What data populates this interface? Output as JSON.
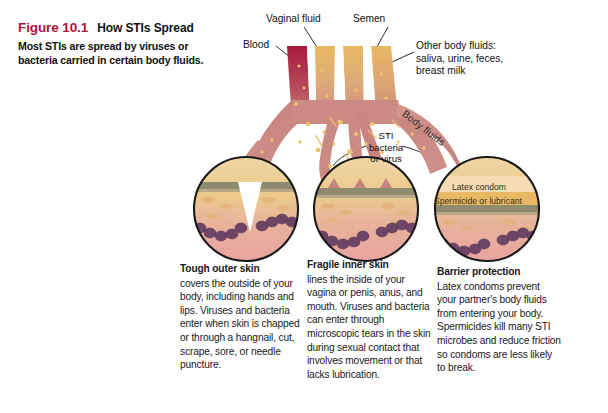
{
  "figure": {
    "number": "Figure 10.1",
    "title": "How STIs Spread",
    "subtitle": "Most STIs are spread by viruses or bacteria carried in certain body fluids."
  },
  "colors": {
    "figure_number": "#b4123c",
    "blood": "#a81b3c",
    "body_fluid": "#e8b863",
    "flesh": "#cc8a84",
    "arrow": "#c9837f",
    "epidermis": "#8e8b6e",
    "dermis": "#eccb8e",
    "subcutaneous": "#e9a99f",
    "cells": "#6e4566",
    "latex_condom": "#f5dcb4",
    "spermicide": "#e8b863"
  },
  "source_labels": [
    {
      "id": "blood",
      "text": "Blood"
    },
    {
      "id": "vaginal",
      "text": "Vaginal fluid"
    },
    {
      "id": "semen",
      "text": "Semen"
    },
    {
      "id": "other",
      "text": "Other body fluids: saliva, urine, feces, breast milk"
    }
  ],
  "diagram_labels": {
    "sti": "STI bacteria or virus",
    "sti_line1": "STI",
    "sti_line2": "bacteria",
    "sti_line3": "or virus",
    "body_fluids": "Body fluids",
    "latex_condom": "Latex condom",
    "spermicide": "Spermicide or lubricant"
  },
  "captions": [
    {
      "head": "Tough outer skin",
      "body": "covers the outside of your body, including hands and lips. Viruses and bacteria enter when skin is chapped or through a hangnail, cut, scrape, sore, or needle puncture."
    },
    {
      "head": "Fragile inner skin",
      "body": "lines the inside of your vagina or penis, anus, and mouth. Viruses and bacteria can enter through microscopic tears in the skin during sexual contact that involves movement or that lacks lubrication."
    },
    {
      "head": "Barrier protection",
      "body": "Latex condoms prevent your partner's body fluids from entering your body. Spermicides kill many STI microbes and reduce friction so condoms are less likely to break."
    }
  ]
}
